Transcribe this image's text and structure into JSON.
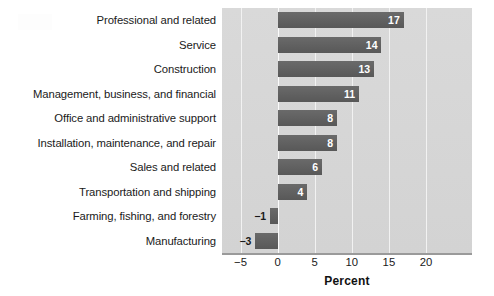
{
  "chart_data": {
    "type": "bar",
    "orientation": "horizontal",
    "title": "",
    "xlabel": "Percent",
    "ylabel": "",
    "xlim": [
      -7.5,
      26.2
    ],
    "xticks": [
      -5,
      0,
      5,
      10,
      15,
      20
    ],
    "xtick_labels": [
      "−5",
      "0",
      "5",
      "10",
      "15",
      "20"
    ],
    "grid": "vertical white gridlines at each x tick",
    "legend": "none",
    "categories": [
      "Professional and related",
      "Service",
      "Construction",
      "Management, business, and financial",
      "Office and administrative support",
      "Installation, maintenance, and repair",
      "Sales and related",
      "Transportation and shipping",
      "Farming, fishing, and forestry",
      "Manufacturing"
    ],
    "values": [
      17,
      14,
      13,
      11,
      8,
      8,
      6,
      4,
      -1,
      -3
    ],
    "value_labels": [
      "17",
      "14",
      "13",
      "11",
      "8",
      "8",
      "6",
      "4",
      "−1",
      "−3"
    ],
    "colors": {
      "bar": "#5f5f5f",
      "plot_background": "#d6d6d6",
      "gridline": "#f2f2f2",
      "axis_line": "#9a9a9a",
      "positive_label": "#ffffff",
      "negative_label": "#1a1a1a",
      "figure_background": "#ffffff"
    }
  }
}
